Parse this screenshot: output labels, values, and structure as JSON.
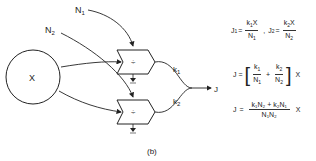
{
  "diagram": {
    "caption": "(b)",
    "nodes": {
      "source": {
        "label": "X"
      },
      "input_n1": {
        "label": "N",
        "sub": "1"
      },
      "input_n2": {
        "label": "N",
        "sub": "2"
      },
      "divider_top": {
        "symbol": "÷"
      },
      "divider_bottom": {
        "symbol": "÷"
      },
      "output": {
        "label": "J"
      }
    },
    "edges": {
      "k1": {
        "label": "k",
        "sub": "1"
      },
      "k2": {
        "label": "k",
        "sub": "2"
      }
    }
  },
  "equations": {
    "eq1": {
      "j1_lhs": "J",
      "j1_lhs_sub": "1",
      "eq": "=",
      "j1_num_k": "k",
      "j1_num_k_sub": "1",
      "j1_num_x": "X",
      "j1_den": "N",
      "j1_den_sub": "1",
      "sep": ",",
      "j2_lhs": "J",
      "j2_lhs_sub": "2",
      "j2_num_k": "k",
      "j2_num_k_sub": "2",
      "j2_num_x": "X",
      "j2_den": "N",
      "j2_den_sub": "2"
    },
    "eq2": {
      "lhs": "J",
      "eq": "=",
      "a_num": "k",
      "a_num_sub": "1",
      "a_den": "N",
      "a_den_sub": "1",
      "plus": "+",
      "b_num": "k",
      "b_num_sub": "2",
      "b_den": "N",
      "b_den_sub": "2",
      "lbr": "[",
      "rbr": "]",
      "x": "X"
    },
    "eq3": {
      "lhs": "J",
      "eq": "=",
      "num": "k₁N₂ + k₂N₁",
      "den": "N₁N₂",
      "x": "X"
    }
  }
}
